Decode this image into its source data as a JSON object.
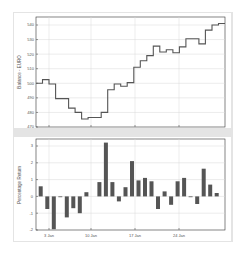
{
  "chart_data": [
    {
      "type": "line",
      "style": "step",
      "title": "",
      "xlabel": "",
      "ylabel": "Balance - EURO",
      "ylim": [
        470,
        545
      ],
      "yticks": [
        470,
        480,
        490,
        500,
        510,
        520,
        530,
        540
      ],
      "xticks": [
        "3 Jan",
        "10 Jan",
        "17 Jan",
        "24 Jan"
      ],
      "grid": true,
      "x": [
        1,
        2,
        3,
        4,
        5,
        6,
        7,
        8,
        9,
        10,
        11,
        12,
        13,
        14,
        15,
        16,
        17,
        18,
        19,
        20,
        21,
        22,
        23,
        24,
        25,
        26,
        27,
        28,
        29
      ],
      "values": [
        500,
        502.5,
        499.5,
        489.5,
        489.5,
        483,
        480,
        475.5,
        476.5,
        476.5,
        480,
        495.5,
        499.5,
        498,
        500.5,
        511,
        515.5,
        519,
        525.5,
        521.5,
        523,
        521,
        525,
        530.5,
        530.5,
        527,
        536.5,
        540,
        541
      ]
    },
    {
      "type": "bar",
      "title": "",
      "xlabel": "",
      "ylabel": "Percentage Return",
      "ylim": [
        -2,
        3.3
      ],
      "yticks": [
        -2,
        -1,
        0,
        1,
        2,
        3
      ],
      "xticks": [
        "3 Jan",
        "10 Jan",
        "17 Jan",
        "24 Jan"
      ],
      "grid": true,
      "x": [
        1,
        2,
        3,
        4,
        5,
        6,
        7,
        8,
        9,
        10,
        11,
        12,
        13,
        14,
        15,
        16,
        17,
        18,
        19,
        20,
        21,
        22,
        23,
        24,
        25,
        26,
        27,
        28,
        29
      ],
      "values": [
        0.6,
        -0.75,
        -1.95,
        -0.05,
        -1.25,
        -0.7,
        -1.0,
        0.25,
        null,
        0.85,
        3.2,
        0.85,
        -0.3,
        0.55,
        2.1,
        0.95,
        1.1,
        0.9,
        -0.75,
        0.3,
        -0.5,
        0.9,
        1.1,
        -0.05,
        -0.45,
        1.65,
        0.7,
        0.2,
        null
      ]
    }
  ],
  "top": {
    "ylabel": "Balance - EURO",
    "yticks": [
      "540",
      "530",
      "520",
      "510",
      "500",
      "490",
      "480",
      "470"
    ]
  },
  "bottom": {
    "ylabel": "Percentage Return",
    "yticks": [
      "3",
      "2",
      "1",
      "0",
      "-1",
      "-2"
    ],
    "xticks": [
      "3 Jan",
      "10 Jan",
      "17 Jan",
      "24 Jan"
    ]
  },
  "colors": {
    "line": "#555555",
    "bar": "#555555",
    "grid": "#d8d8d8",
    "frame": "#e4e4e4"
  }
}
